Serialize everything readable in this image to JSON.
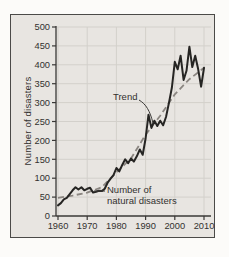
{
  "chart_data": {
    "type": "line",
    "title": "",
    "xlabel": "",
    "ylabel": "Number of disasters",
    "ylim": [
      0,
      500
    ],
    "xlim": [
      1959,
      2011
    ],
    "grid": true,
    "legend_position": "inline-annotations",
    "yticks": [
      0,
      50,
      100,
      150,
      200,
      250,
      300,
      350,
      400,
      450,
      500
    ],
    "xticks": [
      1960,
      1970,
      1980,
      1990,
      2000,
      2010
    ],
    "series": [
      {
        "name": "Number of natural disasters",
        "style": "solid",
        "x_start": 1960,
        "x_step": 1,
        "values": [
          28,
          34,
          44,
          48,
          58,
          68,
          76,
          70,
          76,
          68,
          72,
          75,
          62,
          64,
          67,
          66,
          72,
          88,
          99,
          108,
          127,
          118,
          135,
          150,
          140,
          152,
          144,
          158,
          176,
          162,
          205,
          268,
          233,
          252,
          238,
          252,
          240,
          262,
          300,
          340,
          408,
          388,
          424,
          360,
          384,
          448,
          394,
          424,
          388,
          342,
          392
        ]
      },
      {
        "name": "Trend",
        "style": "dashed",
        "x": [
          1960,
          1965,
          1970,
          1975,
          1980,
          1985,
          1990,
          1995,
          2000,
          2005,
          2010
        ],
        "values": [
          48,
          54,
          62,
          76,
          116,
          152,
          215,
          265,
          322,
          362,
          392
        ]
      }
    ],
    "annotations": {
      "trend_label": "Trend",
      "series_label_line1": "Number of",
      "series_label_line2": "natural disasters"
    },
    "colors": {
      "page_bg": "#fcfbf9",
      "panel_bg": "#e8e5e1",
      "panel_border": "#4b4a48",
      "grid": "#d3d0cb",
      "axis": "#3a3836",
      "text": "#33312f",
      "series_line": "#262523",
      "trend_line": "#8b8681"
    }
  }
}
